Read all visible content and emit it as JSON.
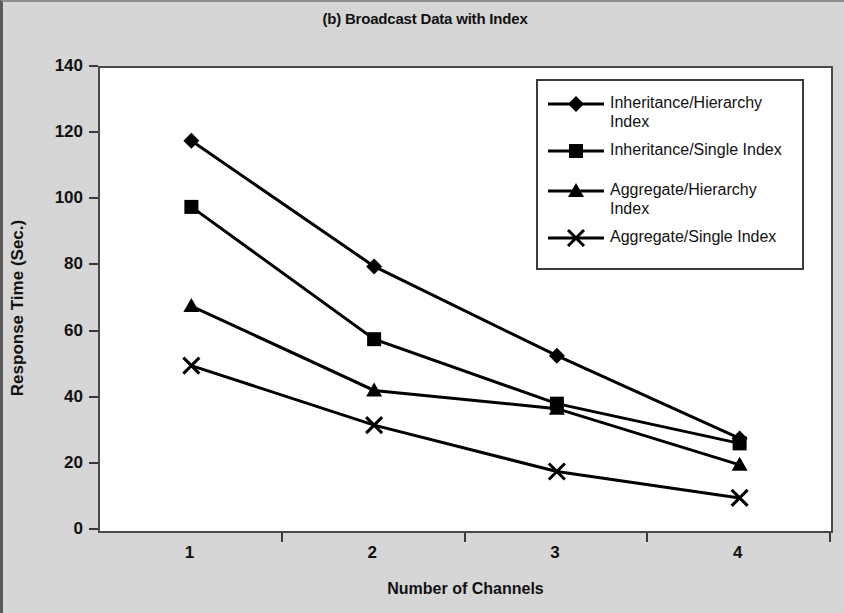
{
  "chart_data": {
    "type": "line",
    "title": "(b) Broadcast Data with Index",
    "xlabel": "Number of Channels",
    "ylabel": "Response Time (Sec.)",
    "categories": [
      "1",
      "2",
      "3",
      "4"
    ],
    "x": [
      1,
      2,
      3,
      4
    ],
    "ylim": [
      0,
      140
    ],
    "ytick_values": [
      0,
      20,
      40,
      60,
      80,
      100,
      120,
      140
    ],
    "ytick_labels": [
      "0",
      "20",
      "40",
      "60",
      "80",
      "100",
      "120",
      "140"
    ],
    "xtick_labels": [
      "1",
      "2",
      "3",
      "4"
    ],
    "grid": false,
    "legend_position": "upper right",
    "series": [
      {
        "name": "Inheritance/Hierarchy Index",
        "legend_label": "Inheritance/Hierarchy\nIndex",
        "marker": "diamond",
        "color": "#000000",
        "values": [
          118,
          80,
          53,
          28
        ]
      },
      {
        "name": "Inheritance/Single Index",
        "legend_label": "Inheritance/Single Index",
        "marker": "square",
        "color": "#000000",
        "values": [
          98,
          58,
          38.5,
          26.5
        ]
      },
      {
        "name": "Aggregate/Hierarchy Index",
        "legend_label": "Aggregate/Hierarchy\nIndex",
        "marker": "triangle",
        "color": "#000000",
        "values": [
          68,
          42.5,
          37,
          20
        ]
      },
      {
        "name": "Aggregate/Single Index",
        "legend_label": "Aggregate/Single Index",
        "marker": "cross",
        "color": "#000000",
        "values": [
          50,
          32,
          18,
          10
        ]
      }
    ]
  }
}
